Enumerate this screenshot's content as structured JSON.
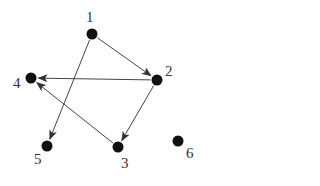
{
  "diagram": {
    "type": "directed-graph",
    "colors": {
      "node": "#111111",
      "edge": "#444444",
      "label": "#333333",
      "background": "#ffffff"
    },
    "nodes": [
      {
        "id": "1",
        "label": "1",
        "x": 92,
        "y": 34,
        "lx": 86,
        "ly": 22
      },
      {
        "id": "2",
        "label": "2",
        "x": 157,
        "y": 80,
        "lx": 165,
        "ly": 76
      },
      {
        "id": "3",
        "label": "3",
        "x": 118,
        "y": 147,
        "lx": 121,
        "ly": 168
      },
      {
        "id": "4",
        "label": "4",
        "x": 31,
        "y": 78,
        "lx": 13,
        "ly": 88
      },
      {
        "id": "5",
        "label": "5",
        "x": 47,
        "y": 146,
        "lx": 34,
        "ly": 164
      },
      {
        "id": "6",
        "label": "6",
        "x": 178,
        "y": 141,
        "lx": 186,
        "ly": 158
      }
    ],
    "edges": [
      {
        "from": "1",
        "to": "2"
      },
      {
        "from": "1",
        "to": "5"
      },
      {
        "from": "2",
        "to": "4"
      },
      {
        "from": "2",
        "to": "3"
      },
      {
        "from": "3",
        "to": "4"
      }
    ]
  }
}
